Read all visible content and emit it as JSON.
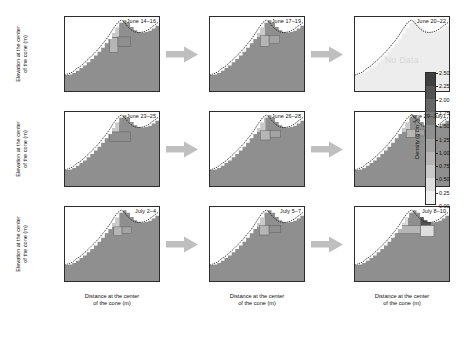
{
  "figure": {
    "type": "heatmap-grid",
    "rows": 3,
    "cols": 3,
    "background": "#ffffff"
  },
  "axes": {
    "x_title_line1": "Distance at the center",
    "x_title_line2": "of the cone (m)",
    "y_title_line1": "Elevation at the center",
    "y_title_line2": "of the cone (m)",
    "x_ticks": [
      "-253",
      "-69",
      "116",
      "301",
      "486"
    ],
    "x_tick_values": [
      -253,
      -69,
      116,
      301,
      486
    ],
    "y_ticks": [
      "572",
      "482",
      "390",
      "298",
      "206",
      "114"
    ],
    "y_tick_values": [
      572,
      482,
      390,
      298,
      206,
      114
    ],
    "xlim": [
      -345,
      578
    ],
    "ylim": [
      68,
      618
    ]
  },
  "colorbar": {
    "title": "Density (g cm",
    "title_exponent": "-3",
    "title_tail": ")",
    "ticks": [
      "2.50",
      "2.25",
      "2.00",
      "1.75",
      "1.50",
      "1.25",
      "1.00",
      "0.75",
      "0.50",
      "0.25",
      "0.00"
    ],
    "tick_values": [
      2.5,
      2.25,
      2.0,
      1.75,
      1.5,
      1.25,
      1.0,
      0.75,
      0.5,
      0.25,
      0.0
    ],
    "vmin": 0.0,
    "vmax": 2.5,
    "n_segments": 10,
    "segment_colors": [
      "#f2f2f2",
      "#dedede",
      "#cacaca",
      "#b6b6b6",
      "#a3a3a3",
      "#8f8f8f",
      "#7b7b7b",
      "#676767",
      "#535353",
      "#3f3f3f"
    ]
  },
  "arrow": {
    "color": "#bfbfbf",
    "name": "flow-arrow"
  },
  "chart_data": {
    "type": "heatmap",
    "title": "",
    "xlabel": "Distance at the center of the cone (m)",
    "ylabel": "Elevation at the center of the cone (m)",
    "colorbar_label": "Density (g cm-3)",
    "xlim": [
      -345,
      578
    ],
    "ylim": [
      68,
      618
    ],
    "legend_position": "right",
    "grid": false,
    "panels": [
      {
        "row": 0,
        "col": 0,
        "label": "June 14–16",
        "no_data": false,
        "base_density": 1.3,
        "summit_patch": {
          "x0": 60,
          "x1": 185,
          "y0": 470,
          "y1": 590,
          "density": 0.55
        },
        "blocks": [
          {
            "x0": 95,
            "x1": 175,
            "y0": 355,
            "y1": 465,
            "density": 0.85
          },
          {
            "x0": 175,
            "x1": 300,
            "y0": 400,
            "y1": 470,
            "density": 1.3
          }
        ]
      },
      {
        "row": 0,
        "col": 1,
        "label": "June 17–19",
        "no_data": false,
        "base_density": 1.3,
        "summit_patch": {
          "x0": 55,
          "x1": 195,
          "y0": 470,
          "y1": 595,
          "density": 0.55
        },
        "blocks": [
          {
            "x0": 150,
            "x1": 235,
            "y0": 400,
            "y1": 480,
            "density": 0.85
          },
          {
            "x0": 235,
            "x1": 340,
            "y0": 420,
            "y1": 480,
            "density": 1.05
          }
        ]
      },
      {
        "row": 0,
        "col": 2,
        "label": "June 20–22",
        "no_data": true,
        "base_density": null,
        "no_data_text": "No Data"
      },
      {
        "row": 1,
        "col": 0,
        "label": "June 23–25",
        "no_data": false,
        "base_density": 1.3,
        "summit_patch": {
          "x0": 60,
          "x1": 185,
          "y0": 470,
          "y1": 590,
          "density": 0.55
        },
        "blocks": [
          {
            "x0": 95,
            "x1": 300,
            "y0": 400,
            "y1": 470,
            "density": 1.3
          }
        ]
      },
      {
        "row": 1,
        "col": 1,
        "label": "June 26–28",
        "no_data": false,
        "base_density": 1.3,
        "summit_patch": {
          "x0": 55,
          "x1": 200,
          "y0": 470,
          "y1": 595,
          "density": 0.55
        },
        "blocks": [
          {
            "x0": 150,
            "x1": 245,
            "y0": 410,
            "y1": 480,
            "density": 0.95
          },
          {
            "x0": 245,
            "x1": 345,
            "y0": 430,
            "y1": 480,
            "density": 1.15
          }
        ]
      },
      {
        "row": 1,
        "col": 2,
        "label": "June 29–July1",
        "no_data": false,
        "base_density": 1.3,
        "summit_patch": {
          "x0": 55,
          "x1": 195,
          "y0": 470,
          "y1": 595,
          "density": 0.6
        },
        "blocks": [
          {
            "x0": 160,
            "x1": 250,
            "y0": 430,
            "y1": 490,
            "density": 0.75
          },
          {
            "x0": 250,
            "x1": 340,
            "y0": 440,
            "y1": 490,
            "density": 1.1
          }
        ]
      },
      {
        "row": 2,
        "col": 0,
        "label": "July 2–4",
        "no_data": false,
        "base_density": 1.3,
        "summit_patch": {
          "x0": 60,
          "x1": 190,
          "y0": 470,
          "y1": 590,
          "density": 0.55
        },
        "blocks": [
          {
            "x0": 135,
            "x1": 215,
            "y0": 405,
            "y1": 470,
            "density": 0.9
          },
          {
            "x0": 215,
            "x1": 310,
            "y0": 420,
            "y1": 470,
            "density": 1.2
          }
        ]
      },
      {
        "row": 2,
        "col": 1,
        "label": "July 5–7",
        "no_data": false,
        "base_density": 1.3,
        "summit_patch": {
          "x0": 55,
          "x1": 195,
          "y0": 470,
          "y1": 595,
          "density": 0.55
        },
        "blocks": [
          {
            "x0": 140,
            "x1": 235,
            "y0": 410,
            "y1": 480,
            "density": 0.85
          },
          {
            "x0": 235,
            "x1": 350,
            "y0": 430,
            "y1": 480,
            "density": 1.25
          }
        ]
      },
      {
        "row": 2,
        "col": 2,
        "label": "July 8–10",
        "no_data": false,
        "base_density": 1.3,
        "summit_patch": {
          "x0": 85,
          "x1": 175,
          "y0": 480,
          "y1": 595,
          "density": 0.4
        },
        "blocks": [
          {
            "x0": 60,
            "x1": 300,
            "y0": 420,
            "y1": 480,
            "density": 0.8
          },
          {
            "x0": 300,
            "x1": 400,
            "y0": 480,
            "y1": 540,
            "density": 2.2
          },
          {
            "x0": 300,
            "x1": 430,
            "y0": 400,
            "y1": 480,
            "density": 0.35
          }
        ]
      }
    ]
  }
}
